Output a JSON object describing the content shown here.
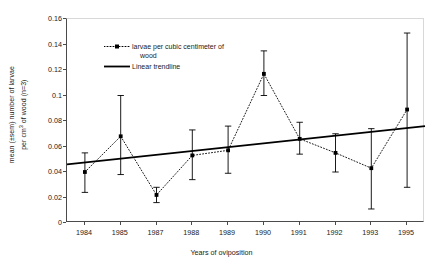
{
  "chart_data": {
    "type": "line",
    "title": "",
    "xlabel": "Years of oviposition",
    "ylabel": "mean (±sem) number of larvae per cm3 of wood (n=3)",
    "ylabel_line1": "mean (±sem) number of larvae",
    "ylabel_line2_pre": "per cm",
    "ylabel_line2_sup": "3",
    "ylabel_line2_post": " of wood (n=3)",
    "categories": [
      "1984",
      "1985",
      "1987",
      "1988",
      "1989",
      "1990",
      "1991",
      "1992",
      "1993",
      "1995"
    ],
    "ylim": [
      0,
      0.16
    ],
    "yticks": [
      "0",
      "0.02",
      "0.04",
      "0.06",
      "0.08",
      "0.1",
      "0.12",
      "0.14",
      "0.16"
    ],
    "ytick_values": [
      0,
      0.02,
      0.04,
      0.06,
      0.08,
      0.1,
      0.12,
      0.14,
      0.16
    ],
    "grid": false,
    "legend_position": "upper-left-inside",
    "series": [
      {
        "name": "larvae per cubic centimeter of wood",
        "style": "dotted-with-markers",
        "color": "#000000",
        "values": [
          0.04,
          0.068,
          0.022,
          0.053,
          0.057,
          0.117,
          0.066,
          0.055,
          0.043,
          0.089
        ],
        "error_low": [
          0.024,
          0.038,
          0.016,
          0.034,
          0.039,
          0.1,
          0.054,
          0.04,
          0.011,
          0.028
        ],
        "error_high": [
          0.055,
          0.1,
          0.028,
          0.073,
          0.076,
          0.135,
          0.079,
          0.07,
          0.074,
          0.149
        ]
      },
      {
        "name": "Linear trendline",
        "style": "solid",
        "color": "#000000",
        "values": [
          0.0465,
          0.0492,
          0.0519,
          0.0546,
          0.0573,
          0.06,
          0.0627,
          0.0654,
          0.0681,
          0.0708
        ],
        "endpoints": [
          0.046,
          0.076
        ]
      }
    ]
  },
  "legend": {
    "items": [
      {
        "label_line1": "larvae per cubic centimeter of",
        "label_line2": "wood",
        "key": "dotted-marker-key"
      },
      {
        "label_line1": "Linear trendline",
        "label_line2": "",
        "key": "solid-line-key"
      }
    ]
  },
  "colors": {
    "axis": "#4a4a4a",
    "frame_light": "#d8d8d8",
    "data": "#000000",
    "background": "#ffffff"
  }
}
